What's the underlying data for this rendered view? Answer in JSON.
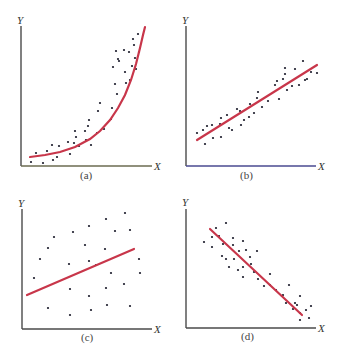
{
  "colors": {
    "fit_line": "#c8364a",
    "axis": "#4a4a4a",
    "axis_tint_a": "#b8b860",
    "axis_tint_b": "#3a3aa0",
    "points": "#1a1a2a"
  },
  "chart_data": [
    {
      "type": "scatter",
      "panel_label": "(a)",
      "xlabel": "X",
      "ylabel": "Y",
      "grid": false,
      "fit": "exponential curve (curvilinear positive relationship)",
      "fit_points": [
        [
          30,
          157
        ],
        [
          45,
          155
        ],
        [
          60,
          152
        ],
        [
          75,
          147
        ],
        [
          90,
          139
        ],
        [
          100,
          131
        ],
        [
          110,
          120
        ],
        [
          118,
          108
        ],
        [
          125,
          95
        ],
        [
          131,
          80
        ],
        [
          136,
          64
        ],
        [
          140,
          48
        ],
        [
          143,
          35
        ],
        [
          145,
          27
        ]
      ],
      "points": [
        [
          31,
          162
        ],
        [
          36,
          153
        ],
        [
          43,
          163
        ],
        [
          47,
          151
        ],
        [
          52,
          145
        ],
        [
          53,
          160
        ],
        [
          57,
          157
        ],
        [
          59,
          146
        ],
        [
          68,
          142
        ],
        [
          70,
          154
        ],
        [
          74,
          143
        ],
        [
          75,
          131
        ],
        [
          76,
          137
        ],
        [
          79,
          146
        ],
        [
          86,
          140
        ],
        [
          89,
          120
        ],
        [
          88,
          126
        ],
        [
          85,
          131
        ],
        [
          91,
          145
        ],
        [
          97,
          133
        ],
        [
          104,
          129
        ],
        [
          98,
          111
        ],
        [
          100,
          103
        ],
        [
          112,
          108
        ],
        [
          111,
          119
        ],
        [
          117,
          94
        ],
        [
          113,
          67
        ],
        [
          115,
          84
        ],
        [
          118,
          59
        ],
        [
          116,
          51
        ],
        [
          119,
          61
        ],
        [
          124,
          50
        ],
        [
          125,
          72
        ],
        [
          126,
          83
        ],
        [
          129,
          52
        ],
        [
          130,
          80
        ],
        [
          132,
          66
        ],
        [
          133,
          39
        ],
        [
          134,
          45
        ],
        [
          135,
          58
        ],
        [
          136,
          69
        ],
        [
          138,
          34
        ],
        [
          139,
          52
        ]
      ]
    },
    {
      "type": "scatter",
      "panel_label": "(b)",
      "xlabel": "X",
      "ylabel": "Y",
      "grid": false,
      "fit": "straight line (positive linear relationship)",
      "fit_line": [
        [
          197,
          140
        ],
        [
          317,
          65
        ]
      ],
      "points": [
        [
          197,
          133
        ],
        [
          203,
          130
        ],
        [
          205,
          144
        ],
        [
          207,
          126
        ],
        [
          212,
          125
        ],
        [
          213,
          138
        ],
        [
          220,
          124
        ],
        [
          221,
          137
        ],
        [
          221,
          118
        ],
        [
          227,
          115
        ],
        [
          229,
          128
        ],
        [
          232,
          130
        ],
        [
          237,
          109
        ],
        [
          240,
          111
        ],
        [
          241,
          125
        ],
        [
          244,
          120
        ],
        [
          249,
          117
        ],
        [
          250,
          104
        ],
        [
          254,
          113
        ],
        [
          257,
          98
        ],
        [
          258,
          92
        ],
        [
          262,
          107
        ],
        [
          268,
          101
        ],
        [
          275,
          85
        ],
        [
          277,
          81
        ],
        [
          279,
          99
        ],
        [
          283,
          79
        ],
        [
          285,
          68
        ],
        [
          285,
          74
        ],
        [
          287,
          90
        ],
        [
          292,
          86
        ],
        [
          295,
          69
        ],
        [
          299,
          85
        ],
        [
          303,
          61
        ],
        [
          305,
          80
        ],
        [
          307,
          79
        ],
        [
          311,
          72
        ],
        [
          317,
          73
        ]
      ]
    },
    {
      "type": "scatter",
      "panel_label": "(c)",
      "xlabel": "X",
      "ylabel": "Y",
      "grid": false,
      "fit": "straight line (no clear relationship / weak correlation)",
      "fit_line": [
        [
          27,
          295
        ],
        [
          134,
          249
        ]
      ],
      "points": [
        [
          125,
          213
        ],
        [
          106,
          219
        ],
        [
          89,
          226
        ],
        [
          54,
          237
        ],
        [
          73,
          232
        ],
        [
          115,
          231
        ],
        [
          130,
          230
        ],
        [
          48,
          248
        ],
        [
          85,
          245
        ],
        [
          105,
          249
        ],
        [
          40,
          259
        ],
        [
          69,
          264
        ],
        [
          89,
          261
        ],
        [
          139,
          259
        ],
        [
          34,
          278
        ],
        [
          111,
          273
        ],
        [
          96,
          265
        ],
        [
          140,
          273
        ],
        [
          124,
          284
        ],
        [
          70,
          289
        ],
        [
          106,
          288
        ],
        [
          89,
          296
        ],
        [
          48,
          308
        ],
        [
          70,
          315
        ],
        [
          91,
          310
        ],
        [
          107,
          305
        ],
        [
          130,
          306
        ]
      ]
    },
    {
      "type": "scatter",
      "panel_label": "(d)",
      "xlabel": "X",
      "ylabel": "Y",
      "grid": false,
      "fit": "straight line (negative linear relationship)",
      "fit_line": [
        [
          210,
          229
        ],
        [
          302,
          315
        ]
      ],
      "points": [
        [
          226,
          223
        ],
        [
          216,
          228
        ],
        [
          204,
          242
        ],
        [
          212,
          237
        ],
        [
          219,
          236
        ],
        [
          233,
          238
        ],
        [
          243,
          241
        ],
        [
          212,
          247
        ],
        [
          223,
          244
        ],
        [
          233,
          245
        ],
        [
          239,
          251
        ],
        [
          246,
          250
        ],
        [
          222,
          256
        ],
        [
          226,
          259
        ],
        [
          234,
          259
        ],
        [
          250,
          257
        ],
        [
          257,
          251
        ],
        [
          243,
          267
        ],
        [
          251,
          264
        ],
        [
          229,
          267
        ],
        [
          238,
          270
        ],
        [
          243,
          277
        ],
        [
          254,
          272
        ],
        [
          258,
          279
        ],
        [
          270,
          274
        ],
        [
          264,
          286
        ],
        [
          270,
          285
        ],
        [
          276,
          290
        ],
        [
          289,
          285
        ],
        [
          283,
          295
        ],
        [
          282,
          296
        ],
        [
          295,
          303
        ],
        [
          300,
          296
        ],
        [
          286,
          303
        ],
        [
          293,
          309
        ],
        [
          297,
          305
        ],
        [
          300,
          313
        ],
        [
          306,
          310
        ],
        [
          311,
          306
        ],
        [
          300,
          320
        ],
        [
          309,
          318
        ]
      ]
    }
  ]
}
